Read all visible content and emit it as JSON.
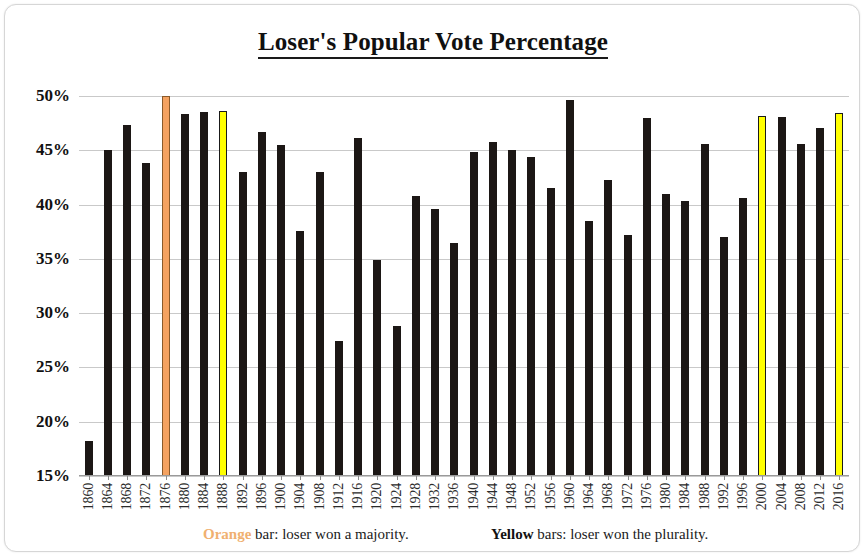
{
  "chart_data": {
    "type": "bar",
    "title": "Loser's Popular Vote Percentage",
    "xlabel": "",
    "ylabel": "",
    "ylim": [
      15,
      50
    ],
    "ytick_labels": [
      "50%",
      "45%",
      "40%",
      "35%",
      "30%",
      "25%",
      "20%",
      "15%"
    ],
    "ytick_values": [
      50,
      45,
      40,
      35,
      30,
      25,
      20,
      15
    ],
    "grid": true,
    "legend_position": "below-axis",
    "categories": [
      "1860",
      "1864",
      "1868",
      "1872",
      "1876",
      "1880",
      "1884",
      "1888",
      "1892",
      "1896",
      "1900",
      "1904",
      "1908",
      "1912",
      "1916",
      "1920",
      "1924",
      "1928",
      "1932",
      "1936",
      "1940",
      "1944",
      "1948",
      "1952",
      "1956",
      "1960",
      "1964",
      "1968",
      "1972",
      "1976",
      "1980",
      "1984",
      "1988",
      "1992",
      "1996",
      "2000",
      "2004",
      "2008",
      "2012",
      "2016"
    ],
    "values": [
      18.2,
      45.0,
      47.3,
      43.8,
      50.0,
      48.3,
      48.5,
      48.6,
      43.0,
      46.7,
      45.5,
      37.6,
      43.0,
      27.4,
      46.1,
      34.9,
      28.8,
      40.8,
      39.6,
      36.5,
      44.8,
      45.8,
      45.0,
      44.4,
      41.5,
      49.6,
      38.5,
      42.3,
      37.2,
      48.0,
      41.0,
      40.3,
      45.6,
      37.0,
      40.6,
      48.2,
      48.1,
      45.6,
      47.1,
      48.4
    ],
    "bar_colors": [
      "black",
      "black",
      "black",
      "black",
      "orange",
      "black",
      "black",
      "yellow",
      "black",
      "black",
      "black",
      "black",
      "black",
      "black",
      "black",
      "black",
      "black",
      "black",
      "black",
      "black",
      "black",
      "black",
      "black",
      "black",
      "black",
      "black",
      "black",
      "black",
      "black",
      "black",
      "black",
      "black",
      "black",
      "black",
      "black",
      "yellow",
      "black",
      "black",
      "black",
      "yellow"
    ],
    "colors": {
      "bar_default": "#1c1715",
      "bar_orange": "#f4a261",
      "bar_yellow": "#ffff00",
      "gridline": "#c9c9c9",
      "border": "#d6d6d6"
    },
    "annotations": [
      {
        "id": "orange-note",
        "keyword": "Orange",
        "text": " bar:  loser won a majority."
      },
      {
        "id": "yellow-note",
        "keyword": "Yellow",
        "text": " bars:  loser won the plurality."
      }
    ]
  },
  "legend": {
    "orange_keyword": "Orange",
    "orange_text": " bar:  loser won a majority.",
    "yellow_keyword": "Yellow",
    "yellow_text": " bars:  loser won the plurality."
  }
}
